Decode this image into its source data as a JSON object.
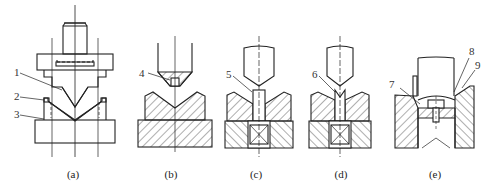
{
  "figure": {
    "subfigures": [
      {
        "id": "a",
        "caption": "(a)",
        "callouts": [
          "1",
          "2",
          "3"
        ]
      },
      {
        "id": "b",
        "caption": "(b)",
        "callouts": [
          "4"
        ]
      },
      {
        "id": "c",
        "caption": "(c)",
        "callouts": [
          "5"
        ]
      },
      {
        "id": "d",
        "caption": "(d)",
        "callouts": [
          "6"
        ]
      },
      {
        "id": "e",
        "caption": "(e)",
        "callouts": [
          "7",
          "8",
          "9"
        ]
      }
    ],
    "colors": {
      "line": "#222222",
      "background": "#ffffff"
    }
  }
}
